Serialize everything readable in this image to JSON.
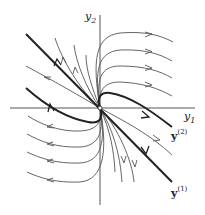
{
  "diagram": {
    "type": "phase-portrait",
    "axes": {
      "x_label": "y",
      "x_sub": "1",
      "y_label": "y",
      "y_sub": "2"
    },
    "eigen_labels": [
      {
        "name": "y",
        "sup": "(2)"
      },
      {
        "name": "y",
        "sup": "(1)"
      }
    ],
    "colors": {
      "axis": "#444444",
      "trajectory": "#555555",
      "eigenline": "#222222",
      "background": "#ffffff"
    }
  }
}
